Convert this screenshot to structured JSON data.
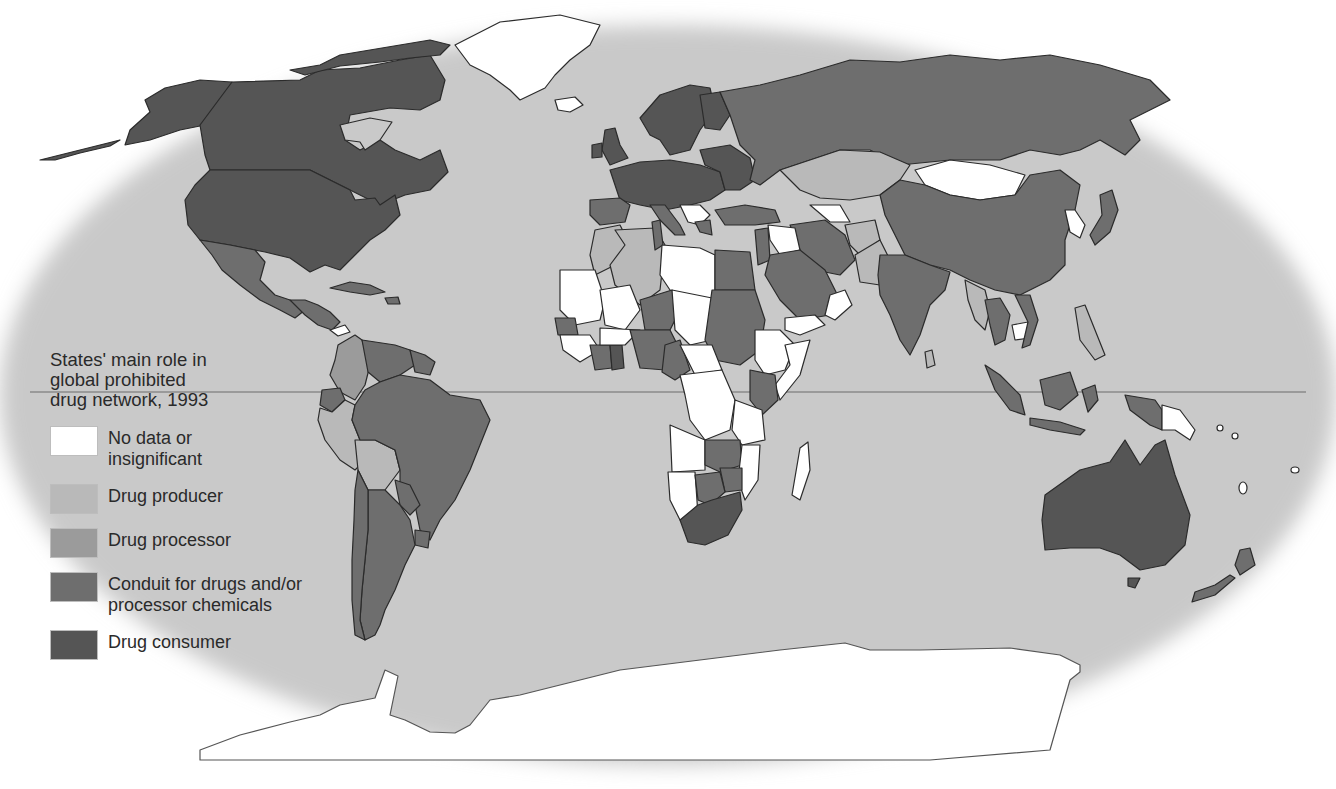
{
  "map": {
    "title": "States' main role in global prohibited drug network, 1993",
    "title_lines": [
      "States' main role in",
      "global prohibited",
      "drug network, 1993"
    ],
    "projection": "elliptical world map (Robinson-like)",
    "equator_shown": true,
    "colors": {
      "ocean": "#c9c9c9",
      "outside": "#ffffff",
      "border": "#2b2b2b",
      "equator": "#8a8a8a"
    },
    "legend": [
      {
        "key": "none",
        "label": "No data or\ninsignificant",
        "color": "#ffffff"
      },
      {
        "key": "producer",
        "label": "Drug producer",
        "color": "#b9b9b9"
      },
      {
        "key": "processor",
        "label": "Drug processor",
        "color": "#9b9b9b"
      },
      {
        "key": "conduit",
        "label": "Conduit for drugs and/or\nprocessor chemicals",
        "color": "#6e6e6e"
      },
      {
        "key": "consumer",
        "label": "Drug consumer",
        "color": "#555555"
      }
    ],
    "regions": {
      "north_america": {
        "Canada": "consumer",
        "United States": "consumer",
        "Alaska": "consumer",
        "Greenland": "none",
        "Mexico": "conduit"
      },
      "central_america_caribbean": {
        "Central America": "conduit",
        "Panama": "none",
        "Caribbean": "conduit"
      },
      "south_america": {
        "Colombia": "processor",
        "Venezuela": "conduit",
        "Guyanas": "conduit",
        "Ecuador": "conduit",
        "Peru": "producer",
        "Bolivia": "producer",
        "Brazil": "conduit",
        "Paraguay": "conduit",
        "Chile": "conduit",
        "Argentina": "conduit",
        "Uruguay": "conduit"
      },
      "europe": {
        "Western Europe": "consumer",
        "Eastern Europe": "consumer",
        "Balkans": "none",
        "Iceland": "none"
      },
      "russia": {
        "Russia": "conduit"
      },
      "asia": {
        "Kazakhstan": "producer",
        "Mongolia": "none",
        "China": "conduit",
        "Japan": "conduit",
        "Korea": "none",
        "India": "conduit",
        "Pakistan": "producer",
        "Afghanistan": "producer",
        "Iran": "conduit",
        "Turkey": "conduit",
        "Myanmar": "producer",
        "Thailand": "conduit",
        "Cambodia": "none",
        "Philippines": "producer",
        "Indonesia": "conduit",
        "Sri Lanka": "producer"
      },
      "middle_east": {
        "Saudi Arabia": "conduit",
        "Yemen": "none",
        "Oman": "none",
        "Iraq": "none",
        "Syria": "conduit"
      },
      "africa": {
        "Morocco": "producer",
        "Algeria": "producer",
        "Tunisia": "conduit",
        "Libya": "none",
        "Egypt": "conduit",
        "Sudan": "conduit",
        "Nigeria": "conduit",
        "Niger": "conduit",
        "Ghana": "consumer",
        "Ivory Coast": "conduit",
        "Senegal": "conduit",
        "Kenya": "conduit",
        "Zimbabwe": "conduit",
        "Zambia": "conduit",
        "Botswana": "conduit",
        "South Africa": "consumer",
        "Madagascar": "none",
        "Ethiopia": "none",
        "Somalia": "none",
        "DR Congo": "none",
        "Angola": "none",
        "Namibia": "none",
        "Mali": "none",
        "Mauritania": "none"
      },
      "oceania": {
        "Australia": "consumer",
        "New Zealand": "conduit",
        "Papua New Guinea": "none",
        "Pacific Islands": "none"
      },
      "antarctica": {
        "Antarctica": "none"
      }
    }
  }
}
